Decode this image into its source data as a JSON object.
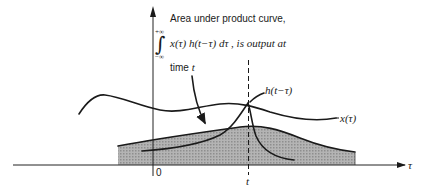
{
  "annotation": {
    "line1": "Area under product curve,",
    "integral_upper": "+∞",
    "integral_lower": "−∞",
    "integral_sign": "∫",
    "formula": "x(τ) h(t−τ) dτ , is output at",
    "line3_prefix": "time ",
    "line3_var": "t"
  },
  "labels": {
    "h_curve": "h(t−τ)",
    "x_curve": "x(τ)",
    "origin": "0",
    "t_marker": "t",
    "tau_axis": "τ"
  },
  "colors": {
    "ink": "#1a1a1a",
    "shade": "#a8a8a8",
    "background": "#ffffff"
  }
}
